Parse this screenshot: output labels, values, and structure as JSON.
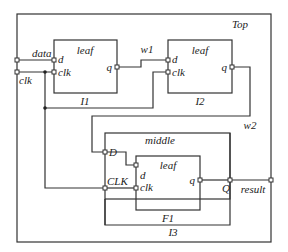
{
  "top": {
    "title": "Top"
  },
  "ports": {
    "data": "data",
    "clk": "clk",
    "result": "result"
  },
  "wires": {
    "w1": "w1",
    "w2": "w2"
  },
  "instances": {
    "i1": {
      "type": "leaf",
      "name": "I1",
      "d": "d",
      "clk": "clk",
      "q": "q"
    },
    "i2": {
      "type": "leaf",
      "name": "I2",
      "d": "d",
      "clk": "clk",
      "q": "q"
    },
    "i3": {
      "type": "middle",
      "name": "I3",
      "D": "D",
      "CLK": "CLK",
      "Q": "Q",
      "f1": {
        "type": "leaf",
        "name": "F1",
        "d": "d",
        "clk": "clk",
        "q": "q"
      }
    }
  }
}
